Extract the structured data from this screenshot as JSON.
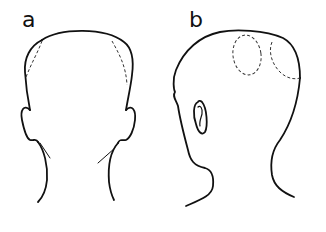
{
  "figure": {
    "panels": [
      {
        "id": "a",
        "label": "a",
        "view": "head from behind",
        "marked_regions": 2,
        "marker_style": "dashed lines"
      },
      {
        "id": "b",
        "label": "b",
        "view": "head from rear-side (three-quarter)",
        "marked_regions": 2,
        "marker_style": "dashed ovals"
      }
    ],
    "colors": {
      "line": "#111111",
      "background": "#ffffff"
    }
  }
}
